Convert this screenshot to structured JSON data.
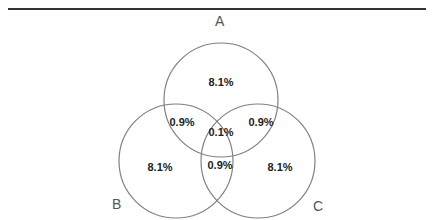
{
  "diagram": {
    "type": "venn3",
    "stroke_color": "#808080",
    "text_color": "#222222",
    "sets": [
      {
        "id": "A",
        "label": "A",
        "cx": 221,
        "cy": 100,
        "r": 57
      },
      {
        "id": "B",
        "label": "B",
        "cx": 176,
        "cy": 161,
        "r": 57
      },
      {
        "id": "C",
        "label": "C",
        "cx": 258,
        "cy": 161,
        "r": 57
      }
    ],
    "regions": {
      "a_only": "8.1%",
      "b_only": "8.1%",
      "c_only": "8.1%",
      "ab": "0.9%",
      "ac": "0.9%",
      "bc": "0.9%",
      "abc": "0.1%"
    }
  }
}
